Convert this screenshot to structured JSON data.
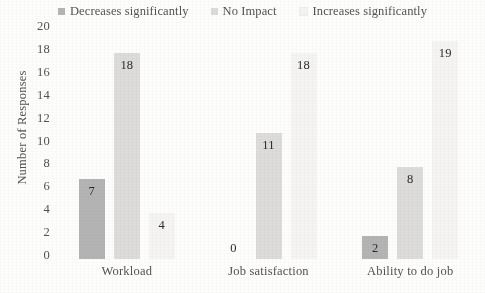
{
  "chart_data": {
    "type": "bar",
    "title": "",
    "xlabel": "",
    "ylabel": "Number of Responses",
    "ylim": [
      0,
      20
    ],
    "ytick_step": 2,
    "yticks": [
      20,
      18,
      16,
      14,
      12,
      10,
      8,
      6,
      4,
      2,
      0
    ],
    "grid": false,
    "legend_position": "top",
    "categories": [
      "Workload",
      "Job satisfaction",
      "Ability to do job"
    ],
    "series": [
      {
        "name": "Decreases significantly",
        "color": "#b4b4b4",
        "values": [
          7,
          0,
          2
        ]
      },
      {
        "name": "No Impact",
        "color": "#dddcda",
        "values": [
          18,
          11,
          8
        ]
      },
      {
        "name": "Increases significantly",
        "color": "#f5f4f2",
        "values": [
          4,
          18,
          19
        ]
      }
    ]
  },
  "legend": {
    "items": [
      {
        "label": "Decreases significantly",
        "color": "#b4b4b4"
      },
      {
        "label": "No Impact",
        "color": "#dddcda"
      },
      {
        "label": "Increases significantly",
        "color": "#f5f4f2"
      }
    ]
  },
  "axis": {
    "y_title": "Number of Responses"
  }
}
